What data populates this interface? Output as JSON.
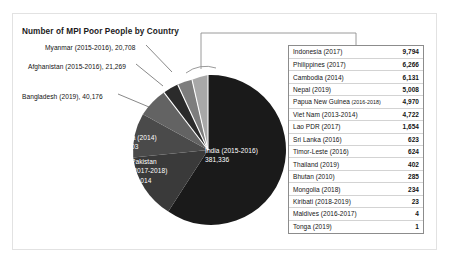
{
  "chart_data": {
    "type": "pie",
    "title": "Number of MPI Poor People by Country",
    "xlabel": "",
    "ylabel": "",
    "legend": "none",
    "grid": false,
    "value_unit": "thousands of people",
    "categories": [
      "India (2015-2016)",
      "Pakistan (2017-2018)",
      "China (2014)",
      "Bangladesh (2019)",
      "Afghanistan (2015-2016)",
      "Myanmar (2015-2016)",
      "Other countries (callout table)"
    ],
    "values": [
      381336,
      83014,
      55703,
      40176,
      21269,
      20708,
      40717
    ],
    "slices": [
      {
        "label": "India (2015-2016)",
        "name": "India",
        "year": "2015-2016",
        "value": 381336,
        "value_text": "381,336",
        "color": "#1a1a1a",
        "label_placement": "inside"
      },
      {
        "label": "Pakistan (2017-2018)",
        "name": "Pakistan",
        "year": "2017-2018",
        "value": 83014,
        "value_text": "83,014",
        "color": "#3a3a3a",
        "label_placement": "inside"
      },
      {
        "label": "China (2014)",
        "name": "China",
        "year": "2014",
        "value": 55703,
        "value_text": "55,703",
        "color": "#4a4a4a",
        "label_placement": "inside"
      },
      {
        "label": "Bangladesh (2019)",
        "name": "Bangladesh",
        "year": "2019",
        "value": 40176,
        "value_text": "40,176",
        "color": "#636363",
        "label_placement": "outside"
      },
      {
        "label": "Afghanistan (2015-2016)",
        "name": "Afghanistan",
        "year": "2015-2016",
        "value": 21269,
        "value_text": "21,269",
        "color": "#2b2b2b",
        "label_placement": "outside"
      },
      {
        "label": "Myanmar (2015-2016)",
        "name": "Myanmar",
        "year": "2015-2016",
        "value": 20708,
        "value_text": "20,708",
        "color": "#7d7d7d",
        "label_placement": "outside"
      },
      {
        "label": "Callout group",
        "name": "Callout",
        "year": "",
        "value": 40717,
        "value_text": "",
        "color": "#a8a8a8",
        "label_placement": "callout"
      }
    ],
    "callout_table": {
      "columns": [
        "Country (year)",
        "Value"
      ],
      "rows": [
        {
          "country": "Indonesia (2017)",
          "year_small": "",
          "value": "9,794"
        },
        {
          "country": "Philippines (2017)",
          "year_small": "",
          "value": "6,266"
        },
        {
          "country": "Cambodia (2014)",
          "year_small": "",
          "value": "6,131"
        },
        {
          "country": "Nepal (2019)",
          "year_small": "",
          "value": "5,008"
        },
        {
          "country": "Papua New Guinea",
          "year_small": "(2016-2018)",
          "value": "4,970"
        },
        {
          "country": "Viet Nam (2013-2014)",
          "year_small": "",
          "value": "4,722"
        },
        {
          "country": "Lao PDR (2017)",
          "year_small": "",
          "value": "1,654"
        },
        {
          "country": "Sri Lanka (2016)",
          "year_small": "",
          "value": "623"
        },
        {
          "country": "Timor-Leste (2016)",
          "year_small": "",
          "value": "624"
        },
        {
          "country": "Thailand (2019)",
          "year_small": "",
          "value": "402"
        },
        {
          "country": "Bhutan (2010)",
          "year_small": "",
          "value": "285"
        },
        {
          "country": "Mongolia (2018)",
          "year_small": "",
          "value": "234"
        },
        {
          "country": "Kiribati (2018-2019)",
          "year_small": "",
          "value": "23"
        },
        {
          "country": "Maldives (2016-2017)",
          "year_small": "",
          "value": "4"
        },
        {
          "country": "Tonga (2019)",
          "year_small": "",
          "value": "1"
        }
      ]
    }
  },
  "labels": {
    "myanmar": "Myanmar (2015-2016), 20,708",
    "afghanistan": "Afghanistan (2015-2016), 21,269",
    "bangladesh": "Bangladesh (2019), 40,176",
    "china_name": "China (2014)",
    "china_value": "55,703",
    "pakistan_name": "Pakistan",
    "pakistan_year": "(2017-2018)",
    "pakistan_value": "83,014",
    "india_name": "India (2015-2016)",
    "india_value": "381,336"
  },
  "colors": {
    "frame_border": "#e2e2e2",
    "table_border": "#8c8c8c",
    "table_row_rule": "#d3d3d3",
    "callout_line": "#8f8f8f",
    "leader_line": "#555555",
    "background": "#ffffff"
  }
}
